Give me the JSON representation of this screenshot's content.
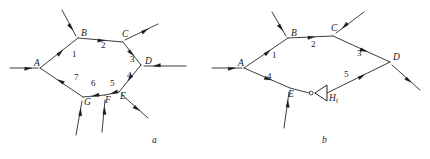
{
  "figure": {
    "ink_color": "#1a1a1a",
    "background": "#ffffff",
    "panels": [
      {
        "id": "a",
        "caption": "a",
        "caption_pos": [
          152,
          143
        ],
        "vertices": [
          {
            "name": "A",
            "label": "A",
            "x": 40,
            "y": 68,
            "lx": 34,
            "ly": 66
          },
          {
            "name": "B",
            "label": "B",
            "x": 78,
            "y": 38,
            "lx": 81,
            "ly": 36
          },
          {
            "name": "C",
            "label": "C",
            "x": 123,
            "y": 42,
            "lx": 122,
            "ly": 37
          },
          {
            "name": "D",
            "label": "D",
            "x": 141,
            "y": 65,
            "lx": 145,
            "ly": 64
          },
          {
            "name": "E",
            "label": "E",
            "x": 119,
            "y": 92,
            "lx": 120,
            "ly": 99
          },
          {
            "name": "F",
            "label": "F",
            "x": 105,
            "y": 95,
            "lx": 105,
            "ly": 103
          },
          {
            "name": "G",
            "label": "G",
            "x": 83,
            "y": 97,
            "lx": 84,
            "ly": 105
          }
        ],
        "edges": [
          {
            "name": "edge-1",
            "label": "1",
            "from": "A",
            "to": "B",
            "lx": 72,
            "ly": 57
          },
          {
            "name": "edge-2",
            "label": "2",
            "from": "B",
            "to": "C",
            "lx": 101,
            "ly": 48
          },
          {
            "name": "edge-3",
            "label": "3",
            "from": "C",
            "to": "D",
            "lx": 130,
            "ly": 62
          },
          {
            "name": "edge-4",
            "label": "4",
            "from": "D",
            "to": "E",
            "lx": 127,
            "ly": 78
          },
          {
            "name": "edge-5",
            "label": "5",
            "from": "E",
            "to": "F",
            "lx": 110,
            "ly": 86
          },
          {
            "name": "edge-6",
            "label": "6",
            "from": "F",
            "to": "G",
            "lx": 91,
            "ly": 86
          },
          {
            "name": "edge-7",
            "label": "7",
            "from": "G",
            "to": "A",
            "lx": 74,
            "ly": 80
          }
        ],
        "external_arrows": [
          {
            "name": "input-arrow-A",
            "x1": 10,
            "y1": 68,
            "x2": 38,
            "y2": 68,
            "dir": "in"
          },
          {
            "name": "input-arrow-B",
            "x1": 62,
            "y1": 10,
            "x2": 76,
            "y2": 36,
            "dir": "in"
          },
          {
            "name": "output-arrow-C",
            "x1": 125,
            "y1": 40,
            "x2": 158,
            "y2": 24,
            "dir": "out"
          },
          {
            "name": "input-arrow-D",
            "x1": 186,
            "y1": 66,
            "x2": 144,
            "y2": 66,
            "dir": "in"
          },
          {
            "name": "output-arrow-E",
            "x1": 121,
            "y1": 94,
            "x2": 148,
            "y2": 118,
            "dir": "out"
          },
          {
            "name": "input-arrow-F",
            "x1": 102,
            "y1": 132,
            "x2": 105,
            "y2": 100,
            "dir": "in"
          },
          {
            "name": "input-arrow-G",
            "x1": 76,
            "y1": 135,
            "x2": 82,
            "y2": 101,
            "dir": "in"
          }
        ]
      },
      {
        "id": "b",
        "caption": "b",
        "caption_pos": [
          322,
          143
        ],
        "vertices": [
          {
            "name": "A",
            "label": "A",
            "x": 244,
            "y": 68,
            "lx": 238,
            "ly": 66
          },
          {
            "name": "B",
            "label": "B",
            "x": 288,
            "y": 38,
            "lx": 291,
            "ly": 36
          },
          {
            "name": "C",
            "label": "C",
            "x": 333,
            "y": 36,
            "lx": 331,
            "ly": 31
          },
          {
            "name": "D",
            "label": "D",
            "x": 390,
            "y": 62,
            "lx": 393,
            "ly": 60
          },
          {
            "name": "E",
            "label": "E",
            "x": 290,
            "y": 88,
            "lx": 288,
            "ly": 97
          }
        ],
        "edges": [
          {
            "name": "edge-1",
            "label": "1",
            "from": "A",
            "to": "B",
            "lx": 272,
            "ly": 58
          },
          {
            "name": "edge-2",
            "label": "2",
            "from": "B",
            "to": "C",
            "lx": 311,
            "ly": 47
          },
          {
            "name": "edge-3",
            "label": "3",
            "from": "C",
            "to": "D",
            "lx": 357,
            "ly": 56
          },
          {
            "name": "edge-4",
            "label": "4",
            "from": "A",
            "to": "E",
            "lx": 267,
            "ly": 79
          },
          {
            "name": "edge-5",
            "label": "5",
            "from": "H",
            "to": "D",
            "lx": 344,
            "ly": 77
          }
        ],
        "element": {
          "name": "inverter-Hf",
          "label": "H",
          "subscript": "f",
          "lx": 329,
          "ly": 101,
          "tip_x": 311,
          "tip_y": 93,
          "base_x": 327,
          "base_y": 93,
          "half_height": 8
        },
        "external_arrows": [
          {
            "name": "input-arrow-A",
            "x1": 212,
            "y1": 68,
            "x2": 242,
            "y2": 68,
            "dir": "in"
          },
          {
            "name": "input-arrow-B",
            "x1": 272,
            "y1": 12,
            "x2": 286,
            "y2": 36,
            "dir": "in"
          },
          {
            "name": "input-arrow-C",
            "x1": 364,
            "y1": 12,
            "x2": 336,
            "y2": 33,
            "dir": "in"
          },
          {
            "name": "output-arrow-D",
            "x1": 392,
            "y1": 65,
            "x2": 420,
            "y2": 90,
            "dir": "out"
          },
          {
            "name": "input-arrow-E",
            "x1": 284,
            "y1": 128,
            "x2": 289,
            "y2": 92,
            "dir": "in"
          }
        ]
      }
    ]
  }
}
